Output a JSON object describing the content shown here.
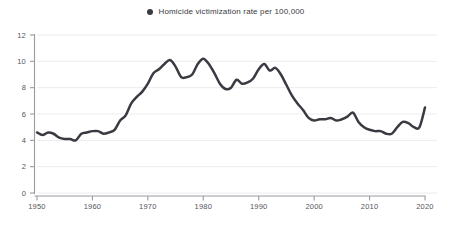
{
  "legend": {
    "marker_icon": "filled-circle-icon",
    "label": "Homicide victimization rate per 100,000",
    "color": "#3a3a42"
  },
  "colors": {
    "line": "#3a3a42",
    "grid": "#ececec",
    "axis": "#9a9aa2",
    "tick_text": "#54545c",
    "background": "#ffffff"
  },
  "chart_data": {
    "type": "line",
    "title": "",
    "subtitle": "",
    "xlabel": "",
    "ylabel": "",
    "xlim": [
      1950,
      2020
    ],
    "ylim": [
      0,
      12
    ],
    "grid": true,
    "legend_position": "top-center",
    "yticks": [
      0,
      2,
      4,
      6,
      8,
      10,
      12
    ],
    "ytick_labels": [
      "0",
      "2",
      "4",
      "6",
      "8",
      "10",
      "12"
    ],
    "xticks": [
      1950,
      1960,
      1970,
      1980,
      1990,
      2000,
      2010,
      2020
    ],
    "xtick_labels": [
      "1950",
      "1960",
      "1970",
      "1980",
      "1990",
      "2000",
      "2010",
      "2020"
    ],
    "series": [
      {
        "name": "Homicide victimization rate per 100,000",
        "color": "#3a3a42",
        "x": [
          1950,
          1951,
          1952,
          1953,
          1954,
          1955,
          1956,
          1957,
          1958,
          1959,
          1960,
          1961,
          1962,
          1963,
          1964,
          1965,
          1966,
          1967,
          1968,
          1969,
          1970,
          1971,
          1972,
          1973,
          1974,
          1975,
          1976,
          1977,
          1978,
          1979,
          1980,
          1981,
          1982,
          1983,
          1984,
          1985,
          1986,
          1987,
          1988,
          1989,
          1990,
          1991,
          1992,
          1993,
          1994,
          1995,
          1996,
          1997,
          1998,
          1999,
          2000,
          2001,
          2002,
          2003,
          2004,
          2005,
          2006,
          2007,
          2008,
          2009,
          2010,
          2011,
          2012,
          2013,
          2014,
          2015,
          2016,
          2017,
          2018,
          2019,
          2020
        ],
        "values": [
          4.6,
          4.4,
          4.6,
          4.5,
          4.2,
          4.1,
          4.1,
          4.0,
          4.5,
          4.6,
          4.7,
          4.7,
          4.5,
          4.6,
          4.8,
          5.5,
          5.9,
          6.8,
          7.3,
          7.7,
          8.3,
          9.1,
          9.4,
          9.8,
          10.1,
          9.6,
          8.8,
          8.8,
          9.0,
          9.8,
          10.2,
          9.8,
          9.1,
          8.3,
          7.9,
          8.0,
          8.6,
          8.3,
          8.4,
          8.7,
          9.4,
          9.8,
          9.3,
          9.5,
          9.0,
          8.2,
          7.4,
          6.8,
          6.3,
          5.7,
          5.5,
          5.6,
          5.6,
          5.7,
          5.5,
          5.6,
          5.8,
          6.1,
          5.4,
          5.0,
          4.8,
          4.7,
          4.7,
          4.5,
          4.5,
          5.0,
          5.4,
          5.3,
          5.0,
          5.0,
          6.5
        ]
      }
    ]
  }
}
